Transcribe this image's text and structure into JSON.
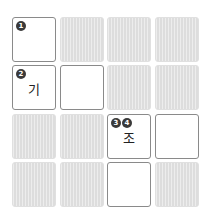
{
  "puzzle": {
    "rows": 4,
    "cols": 4,
    "cells": [
      [
        {
          "type": "white",
          "badges": [
            "1"
          ],
          "value": ""
        },
        {
          "type": "gray"
        },
        {
          "type": "gray"
        },
        {
          "type": "gray"
        }
      ],
      [
        {
          "type": "white",
          "badges": [
            "2"
          ],
          "value": "기"
        },
        {
          "type": "white",
          "badges": [],
          "value": ""
        },
        {
          "type": "gray"
        },
        {
          "type": "gray"
        }
      ],
      [
        {
          "type": "gray"
        },
        {
          "type": "gray"
        },
        {
          "type": "white",
          "badges": [
            "3",
            "4"
          ],
          "value": "조"
        },
        {
          "type": "white",
          "badges": [],
          "value": ""
        }
      ],
      [
        {
          "type": "gray"
        },
        {
          "type": "gray"
        },
        {
          "type": "white",
          "badges": [],
          "value": ""
        },
        {
          "type": "gray"
        }
      ]
    ]
  },
  "colors": {
    "cell_border": "#8a8a8a",
    "blocked": "#e4e4e4",
    "badge": "#3a3a3a"
  }
}
